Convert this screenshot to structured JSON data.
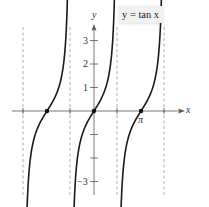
{
  "chart_data": {
    "type": "line",
    "title": "y = tan x",
    "xlabel": "x",
    "ylabel": "y",
    "function": "tan(x)",
    "x_tick_labels": [
      {
        "value": 3.14159,
        "label": "π"
      }
    ],
    "y_tick_labels": [
      {
        "value": 1,
        "label": "1"
      },
      {
        "value": 2,
        "label": "2"
      },
      {
        "value": 3,
        "label": "3"
      },
      {
        "value": -3,
        "label": "−3"
      }
    ],
    "y_ticks": [
      -3,
      -2,
      -1,
      1,
      2,
      3
    ],
    "xlim": [
      -3.6,
      4.7
    ],
    "ylim": [
      -3.5,
      3.5
    ],
    "vertical_asymptotes": [
      -4.712,
      -1.571,
      1.571,
      4.712
    ],
    "zeros_marked": [
      -3.14159,
      0,
      3.14159
    ],
    "branches": [
      {
        "center": -3.14159,
        "x_range": [
          -4.55,
          -1.72
        ]
      },
      {
        "center": 0,
        "x_range": [
          -1.42,
          1.42
        ]
      },
      {
        "center": 3.14159,
        "x_range": [
          1.72,
          4.55
        ]
      }
    ],
    "grid": false,
    "legend": null
  },
  "labels": {
    "title": "y = tan x",
    "x_axis": "x",
    "y_axis": "y",
    "pi": "π",
    "y1": "1",
    "y2": "2",
    "y3": "3",
    "yneg3": "−3"
  },
  "colors": {
    "curve": "#1a1a1a",
    "axis": "#555555",
    "asymptote": "#999999"
  }
}
